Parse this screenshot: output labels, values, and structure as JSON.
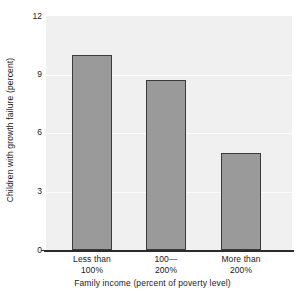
{
  "chart_data": {
    "type": "bar",
    "title": "",
    "xlabel": "Family income (percent of poverty level)",
    "ylabel": "Children with growth failure (percent)",
    "categories": [
      "Less than 100%",
      "100—200%",
      "More than 200%"
    ],
    "category_lines": [
      {
        "line1": "Less than",
        "line2": "100%"
      },
      {
        "line1": "100—",
        "line2": "200%"
      },
      {
        "line1": "More than",
        "line2": "200%"
      }
    ],
    "values": [
      10.0,
      8.7,
      5.0
    ],
    "ylim": [
      0,
      12
    ],
    "yticks": [
      12,
      9,
      6,
      3,
      0
    ],
    "ytick_labels": [
      "12",
      "9",
      "6",
      "3",
      "0"
    ],
    "grid": true,
    "grid_axis": "y",
    "legend": "none",
    "colors": {
      "bar_fill": "#9a9a9a",
      "bar_border": "#3a3a3a",
      "plot_background": "#f0f0f0",
      "gridline": "#fbfbfb",
      "axis": "#2b2b2b",
      "text": "#1a1a1a",
      "page_background": "#ffffff"
    }
  }
}
